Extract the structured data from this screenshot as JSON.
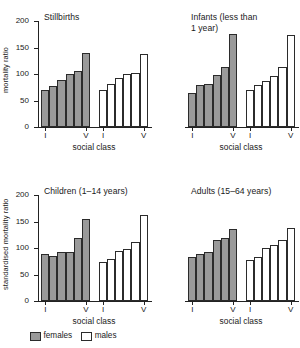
{
  "legend": {
    "females_label": "females",
    "males_label": "males",
    "female_color": "#9a9a9a",
    "male_color": "#ffffff"
  },
  "axes": {
    "top_ylabel": "mortality ratio",
    "bottom_ylabel": "standardised mortality ratio",
    "xlabel": "social class",
    "yticks": [
      "0",
      "50",
      "100",
      "150",
      "200"
    ],
    "ymin": 0,
    "ymax": 200,
    "xticks": [
      "I",
      "V",
      "I",
      "V"
    ]
  },
  "chart_data": [
    {
      "type": "bar",
      "title": "Stillbirths",
      "xlabel": "social class",
      "ylabel": "mortality ratio",
      "ylim": [
        0,
        200
      ],
      "categories": [
        "I",
        "II",
        "III",
        "IV",
        "V"
      ],
      "series": [
        {
          "name": "females",
          "values": [
            68,
            77,
            88,
            99,
            104,
            139
          ]
        },
        {
          "name": "males",
          "values": [
            68,
            80,
            91,
            99,
            101,
            138
          ]
        }
      ]
    },
    {
      "type": "bar",
      "title": "Infants (less than\n1 year)",
      "xlabel": "social class",
      "ylabel": "mortality ratio",
      "ylim": [
        0,
        200
      ],
      "categories": [
        "I",
        "II",
        "III",
        "IV",
        "V"
      ],
      "series": [
        {
          "name": "females",
          "values": [
            62,
            78,
            80,
            98,
            113,
            175
          ]
        },
        {
          "name": "males",
          "values": [
            68,
            78,
            86,
            95,
            112,
            174
          ]
        }
      ]
    },
    {
      "type": "bar",
      "title": "Children (1–14 years)",
      "xlabel": "social class",
      "ylabel": "standardised mortality ratio",
      "ylim": [
        0,
        200
      ],
      "categories": [
        "I",
        "II",
        "III",
        "IV",
        "V"
      ],
      "series": [
        {
          "name": "females",
          "values": [
            88,
            83,
            91,
            91,
            118,
            155
          ]
        },
        {
          "name": "males",
          "values": [
            73,
            78,
            94,
            97,
            111,
            161
          ]
        }
      ]
    },
    {
      "type": "bar",
      "title": "Adults (15–64 years)",
      "xlabel": "social class",
      "ylabel": "standardised mortality ratio",
      "ylim": [
        0,
        200
      ],
      "categories": [
        "I",
        "II",
        "III",
        "IV",
        "V"
      ],
      "series": [
        {
          "name": "females",
          "values": [
            82,
            87,
            92,
            115,
            119,
            135
          ]
        },
        {
          "name": "males",
          "values": [
            77,
            81,
            100,
            104,
            114,
            137
          ]
        }
      ]
    }
  ]
}
